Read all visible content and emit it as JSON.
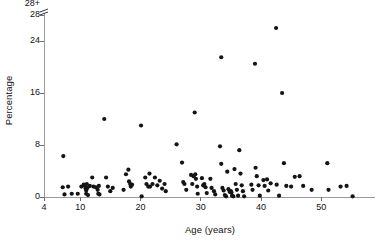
{
  "chart_data": {
    "type": "scatter",
    "title": "",
    "xlabel": "Age (years)",
    "ylabel": "Percentage",
    "xlim": [
      4,
      55.5
    ],
    "ylim": [
      0,
      28
    ],
    "grid": false,
    "legend": null,
    "xticks": [
      4,
      10,
      20,
      30,
      40,
      50
    ],
    "xtick_labels": [
      "4",
      "10",
      "20",
      "30",
      "40",
      "50"
    ],
    "yticks": [
      0,
      8,
      16,
      24,
      28
    ],
    "ytick_labels": [
      "0",
      "8",
      "16",
      "24",
      "28"
    ],
    "y_axis_break": true,
    "y_axis_break_label": "28+",
    "marker": "filled-circle",
    "marker_color": "#141414",
    "marker_size": 2.1,
    "points": [
      [
        7.2,
        6.3
      ],
      [
        7.1,
        1.5
      ],
      [
        7.4,
        0.4
      ],
      [
        8.0,
        1.6
      ],
      [
        8.6,
        0.5
      ],
      [
        9.6,
        0.5
      ],
      [
        10.2,
        1.6
      ],
      [
        10.6,
        1.9
      ],
      [
        10.8,
        1.7
      ],
      [
        10.9,
        1.3
      ],
      [
        11.0,
        1.0
      ],
      [
        11.0,
        0.5
      ],
      [
        11.1,
        2.0
      ],
      [
        11.2,
        1.4
      ],
      [
        11.3,
        0.3
      ],
      [
        11.6,
        1.7
      ],
      [
        12.0,
        3.0
      ],
      [
        12.2,
        1.6
      ],
      [
        12.6,
        1.5
      ],
      [
        12.9,
        1.1
      ],
      [
        13.0,
        0.5
      ],
      [
        13.1,
        1.7
      ],
      [
        13.2,
        0.4
      ],
      [
        14.0,
        12.0
      ],
      [
        14.3,
        3.0
      ],
      [
        14.6,
        1.6
      ],
      [
        15.0,
        0.9
      ],
      [
        15.4,
        1.4
      ],
      [
        17.2,
        1.1
      ],
      [
        17.6,
        3.5
      ],
      [
        18.0,
        4.2
      ],
      [
        18.1,
        2.4
      ],
      [
        18.3,
        2.0
      ],
      [
        18.4,
        1.6
      ],
      [
        18.6,
        1.9
      ],
      [
        20.1,
        11.0
      ],
      [
        20.2,
        0.1
      ],
      [
        20.8,
        3.0
      ],
      [
        21.0,
        2.0
      ],
      [
        21.3,
        1.6
      ],
      [
        21.5,
        3.6
      ],
      [
        21.6,
        1.6
      ],
      [
        22.0,
        2.0
      ],
      [
        22.4,
        3.0
      ],
      [
        22.8,
        1.8
      ],
      [
        23.2,
        2.5
      ],
      [
        23.6,
        1.3
      ],
      [
        24.0,
        2.0
      ],
      [
        24.2,
        0.9
      ],
      [
        26.0,
        8.1
      ],
      [
        26.9,
        5.3
      ],
      [
        27.1,
        2.3
      ],
      [
        27.3,
        2.0
      ],
      [
        27.6,
        1.1
      ],
      [
        28.4,
        3.4
      ],
      [
        28.6,
        2.0
      ],
      [
        28.8,
        3.2
      ],
      [
        29.0,
        13.0
      ],
      [
        29.1,
        3.5
      ],
      [
        29.2,
        2.8
      ],
      [
        29.4,
        1.6
      ],
      [
        29.5,
        0.5
      ],
      [
        30.2,
        2.9
      ],
      [
        30.4,
        1.8
      ],
      [
        30.6,
        2.0
      ],
      [
        30.8,
        1.5
      ],
      [
        31.0,
        0.6
      ],
      [
        31.6,
        2.8
      ],
      [
        31.8,
        1.4
      ],
      [
        32.2,
        0.9
      ],
      [
        32.4,
        0.4
      ],
      [
        33.4,
        21.5
      ],
      [
        33.2,
        7.8
      ],
      [
        33.4,
        5.1
      ],
      [
        33.6,
        1.4
      ],
      [
        33.8,
        1.0
      ],
      [
        34.0,
        0.3
      ],
      [
        34.2,
        0.1
      ],
      [
        34.4,
        3.9
      ],
      [
        34.6,
        1.2
      ],
      [
        34.8,
        0.8
      ],
      [
        35.0,
        0.9
      ],
      [
        35.1,
        0.7
      ],
      [
        35.2,
        0.2
      ],
      [
        35.4,
        0.1
      ],
      [
        35.6,
        4.3
      ],
      [
        35.8,
        2.0
      ],
      [
        36.0,
        1.1
      ],
      [
        36.2,
        0.2
      ],
      [
        36.4,
        7.2
      ],
      [
        36.6,
        3.6
      ],
      [
        36.8,
        1.8
      ],
      [
        37.0,
        0.9
      ],
      [
        37.2,
        0.1
      ],
      [
        38.4,
        1.9
      ],
      [
        38.6,
        1.1
      ],
      [
        39.0,
        20.5
      ],
      [
        39.1,
        4.5
      ],
      [
        39.3,
        3.2
      ],
      [
        39.6,
        1.8
      ],
      [
        39.8,
        0.2
      ],
      [
        40.4,
        2.6
      ],
      [
        40.6,
        1.7
      ],
      [
        41.0,
        2.7
      ],
      [
        41.2,
        1.0
      ],
      [
        41.6,
        2.1
      ],
      [
        42.5,
        26.0
      ],
      [
        42.6,
        1.9
      ],
      [
        43.0,
        0.2
      ],
      [
        43.5,
        16.0
      ],
      [
        43.8,
        5.2
      ],
      [
        44.2,
        1.7
      ],
      [
        45.0,
        1.6
      ],
      [
        45.6,
        3.1
      ],
      [
        46.4,
        3.2
      ],
      [
        47.0,
        1.7
      ],
      [
        48.4,
        1.1
      ],
      [
        51.0,
        5.2
      ],
      [
        51.2,
        1.1
      ],
      [
        53.2,
        1.6
      ],
      [
        54.2,
        1.7
      ],
      [
        55.2,
        0.1
      ]
    ]
  }
}
